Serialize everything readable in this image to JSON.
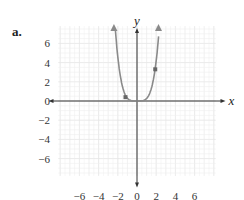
{
  "part_label": "a.",
  "chart_data": {
    "type": "line",
    "title": "",
    "xlabel": "x",
    "ylabel": "y",
    "xlim": [
      -8,
      8
    ],
    "ylim": [
      -8,
      8
    ],
    "grid": true,
    "x_ticks": [
      "-6",
      "-4",
      "-2",
      "0",
      "2",
      "4",
      "6"
    ],
    "y_ticks": [
      "6",
      "4",
      "2",
      "0",
      "-2",
      "-4",
      "-6"
    ],
    "series": [
      {
        "name": "curve",
        "description": "U-shaped curve (quartic-like), flat near origin, rising steeply with arrows at both ends",
        "x": [
          -2.4,
          -2,
          -1.5,
          -1.2,
          -1,
          -0.5,
          0,
          0.5,
          1,
          1.5,
          1.9,
          2.2
        ],
        "y": [
          7.5,
          4.5,
          1.6,
          0.5,
          0.3,
          0.05,
          0,
          0.05,
          0.6,
          1.9,
          3.3,
          7.5
        ]
      }
    ],
    "marked_points": [
      {
        "x": -1.2,
        "y": 0.4
      },
      {
        "x": 1.9,
        "y": 3.3
      }
    ],
    "colors": {
      "curve": "#8a8a8a",
      "axes": "#333333",
      "grid": "#e6e6e6"
    }
  }
}
